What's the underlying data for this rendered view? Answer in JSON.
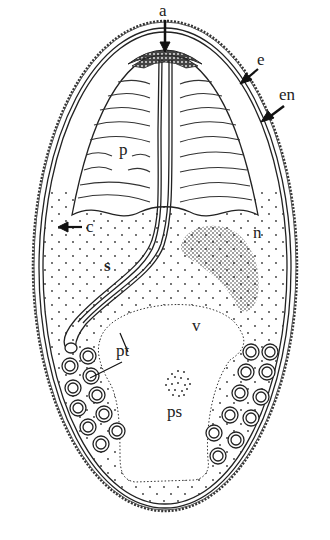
{
  "diagram": {
    "labels": {
      "a": "a",
      "e": "e",
      "en": "en",
      "p": "p",
      "c": "c",
      "n": "n",
      "s": "s",
      "v": "v",
      "pt": "pt",
      "ps": "ps"
    },
    "colors": {
      "ink": "#222222",
      "background": "#ffffff"
    }
  }
}
